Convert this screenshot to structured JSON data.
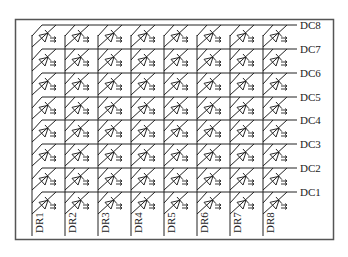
{
  "diagram": {
    "type": "LED dot-matrix schematic (8x8)",
    "row_labels": [
      "DC8",
      "DC7",
      "DC6",
      "DC5",
      "DC4",
      "DC3",
      "DC2",
      "DC1"
    ],
    "column_labels": [
      "DR1",
      "DR2",
      "DR3",
      "DR4",
      "DR5",
      "DR6",
      "DR7",
      "DR8"
    ],
    "rows": 8,
    "columns": 8,
    "element_icon": "led-diode-icon",
    "colors": {
      "line": "#222222",
      "frame": "#555555",
      "background": "#ffffff"
    }
  }
}
